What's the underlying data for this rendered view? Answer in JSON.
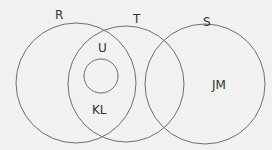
{
  "diagram": {
    "type": "venn",
    "stroke_color": "#6e6e6e",
    "background": "#f1f1ef",
    "sets": [
      {
        "name": "R",
        "cx": 76,
        "cy": 83,
        "r": 60,
        "label_x": 55,
        "label_y": 19
      },
      {
        "name": "T",
        "cx": 126,
        "cy": 84,
        "r": 58,
        "label_x": 133,
        "label_y": 23
      },
      {
        "name": "S",
        "cx": 205,
        "cy": 84,
        "r": 60,
        "label_x": 203,
        "label_y": 26
      },
      {
        "name": "",
        "cx": 101,
        "cy": 76,
        "r": 17
      }
    ],
    "region_labels": [
      {
        "text": "U",
        "x": 98,
        "y": 52
      },
      {
        "text": "KL",
        "x": 97,
        "y": 114
      },
      {
        "text": "JM",
        "x": 216,
        "y": 89
      }
    ]
  }
}
